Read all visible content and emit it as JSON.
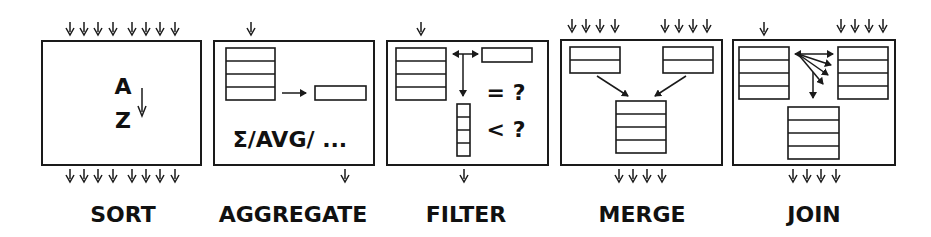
{
  "operators": [
    {
      "id": "sort",
      "label": "SORT",
      "content": {
        "top": "A",
        "bottom": "Z"
      }
    },
    {
      "id": "aggregate",
      "label": "AGGREGATE",
      "content": {
        "formula": "Σ/AVG/ ..."
      }
    },
    {
      "id": "filter",
      "label": "FILTER",
      "content": {
        "cond1": "= ?",
        "cond2": "< ?"
      }
    },
    {
      "id": "merge",
      "label": "MERGE"
    },
    {
      "id": "join",
      "label": "JOIN"
    }
  ],
  "colors": {
    "stroke": "#1a1a1a",
    "background": "#ffffff"
  }
}
